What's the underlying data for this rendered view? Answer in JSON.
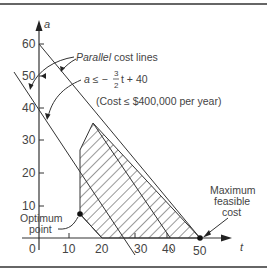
{
  "figure": {
    "axes": {
      "x_label": "t",
      "y_label": "a",
      "x_ticks": [
        "0",
        "10",
        "20",
        "30",
        "40",
        "50"
      ],
      "y_ticks": [
        "10",
        "20",
        "30",
        "40",
        "50",
        "60"
      ]
    },
    "annotations": {
      "parallel_cost_lines_italic": "Parallel",
      "parallel_cost_lines_rest": " cost lines",
      "constraint_lhs": "a ≤ −",
      "constraint_frac_num": "3",
      "constraint_frac_den": "2",
      "constraint_rhs": "t + 40",
      "cost_note": "(Cost ≤ $400,000 per year)",
      "optimum_line1": "Optimum",
      "optimum_line2": "point",
      "max_line1": "Maximum",
      "max_line2": "feasible",
      "max_line3": "cost"
    },
    "colors": {
      "line": "#333333",
      "text": "#444444",
      "frame": "#666666"
    }
  }
}
